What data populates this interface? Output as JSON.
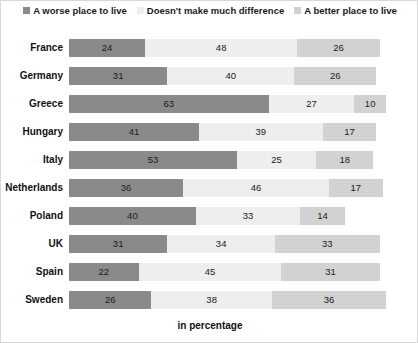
{
  "chart_data": {
    "type": "bar",
    "subtype": "stacked-horizontal",
    "title": "",
    "xlabel": "in percentage",
    "ylabel": "",
    "grid": false,
    "legend_position": "top-center",
    "xlim": [
      0,
      100
    ],
    "categories": [
      "France",
      "Germany",
      "Greece",
      "Hungary",
      "Italy",
      "Netherlands",
      "Poland",
      "UK",
      "Spain",
      "Sweden"
    ],
    "series": [
      {
        "name": "A worse place to live",
        "color": "#8a8a8a",
        "values": [
          24,
          31,
          63,
          41,
          53,
          36,
          40,
          31,
          22,
          26
        ]
      },
      {
        "name": "Doesn't make much difference",
        "color": "#eeeeee",
        "values": [
          48,
          40,
          27,
          39,
          25,
          46,
          33,
          34,
          45,
          38
        ]
      },
      {
        "name": "A better place to live",
        "color": "#d2d2d2",
        "values": [
          26,
          26,
          10,
          17,
          18,
          17,
          14,
          33,
          31,
          36
        ]
      }
    ]
  },
  "axis": {
    "xlabel": "in percentage"
  }
}
